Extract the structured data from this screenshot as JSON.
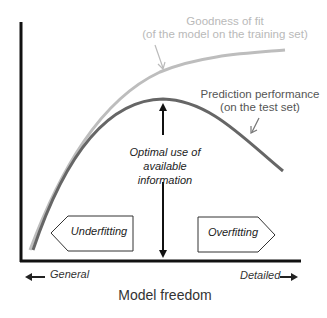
{
  "diagram": {
    "curves": {
      "goodness_of_fit": {
        "label_line1": "Goodness of fit",
        "label_line2": "(of the model on the training set)",
        "color": "#bdbdbd"
      },
      "prediction_performance": {
        "label_line1": "Prediction performance",
        "label_line2": "(on the test set)",
        "color": "#666666"
      }
    },
    "optimal": {
      "line1": "Optimal use of",
      "line2": "available",
      "line3": "information"
    },
    "regions": {
      "left": "Underfitting",
      "right": "Overfitting"
    },
    "x_axis": {
      "left_label": "General",
      "right_label": "Detailed",
      "title": "Model freedom"
    }
  }
}
